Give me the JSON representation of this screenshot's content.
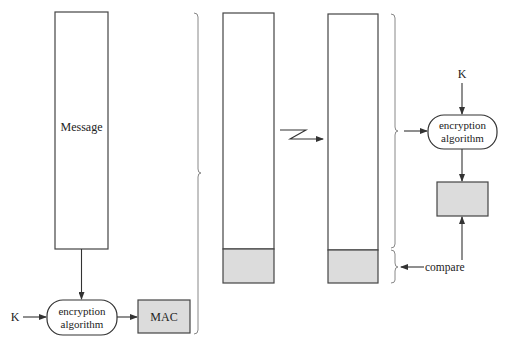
{
  "diagram": {
    "sender": {
      "message_label": "Message",
      "key_label": "K",
      "algorithm_line1": "encryption",
      "algorithm_line2": "algorithm",
      "mac_label": "MAC"
    },
    "transmission": {
      "channel_icon": "lightning-arrow-icon"
    },
    "receiver": {
      "key_label": "K",
      "algorithm_line1": "encryption",
      "algorithm_line2": "algorithm",
      "compare_label": "compare"
    },
    "colors": {
      "stroke": "#333333",
      "mac_fill": "#dcdcdc",
      "brace": "#888888"
    }
  }
}
